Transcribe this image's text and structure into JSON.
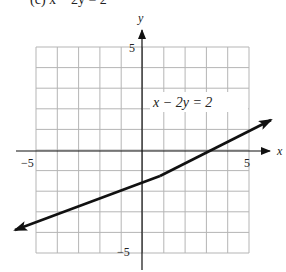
{
  "header": {
    "cut_off_text": "(c) x − 2y = 2"
  },
  "graph": {
    "equation_label": "x − 2y = 2",
    "x_axis_label": "x",
    "y_axis_label": "y",
    "x_tick_labels": {
      "min": "−5",
      "max": "5"
    },
    "y_tick_labels": {
      "min": "−5",
      "max": "5"
    }
  },
  "chart_data": {
    "type": "line",
    "title": "",
    "equation": "x - 2y = 2",
    "xlabel": "x",
    "ylabel": "y",
    "xlim": [
      -5,
      5
    ],
    "ylim": [
      -5,
      5
    ],
    "grid": true,
    "grid_step": 1,
    "series": [
      {
        "name": "x - 2y = 2",
        "slope": 0.5,
        "intercept": -1,
        "x": [
          -6,
          -4,
          -2,
          0,
          2,
          4,
          6
        ],
        "y": [
          -4,
          -3,
          -2,
          -1,
          0,
          1,
          2
        ],
        "arrows_both_ends": true
      }
    ],
    "annotations": [
      {
        "text": "x − 2y = 2",
        "x": 2.7,
        "y": 2.4
      }
    ]
  },
  "colors": {
    "grid": "#b5b5b5",
    "axis": "#111111",
    "line": "#111111",
    "background": "#ffffff"
  }
}
